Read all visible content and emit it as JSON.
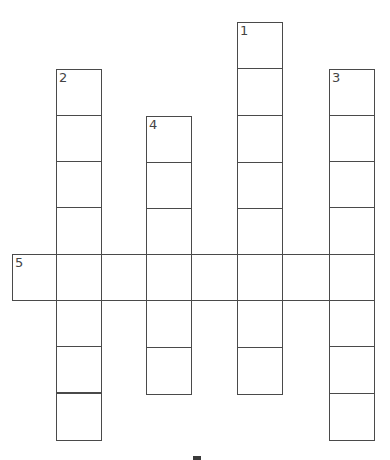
{
  "puzzle": {
    "type": "crossword",
    "line_color": "#4a4a4a",
    "clue_numbers": {
      "n1": "1",
      "n2": "2",
      "n3": "3",
      "n4": "4",
      "n5": "5"
    },
    "entries": [
      {
        "number": "1",
        "direction": "down",
        "length": 8
      },
      {
        "number": "2",
        "direction": "down",
        "length": 8
      },
      {
        "number": "3",
        "direction": "down",
        "length": 8
      },
      {
        "number": "4",
        "direction": "down",
        "length": 6
      },
      {
        "number": "5",
        "direction": "across",
        "length": 8
      }
    ],
    "bottom_partial_text": ""
  }
}
